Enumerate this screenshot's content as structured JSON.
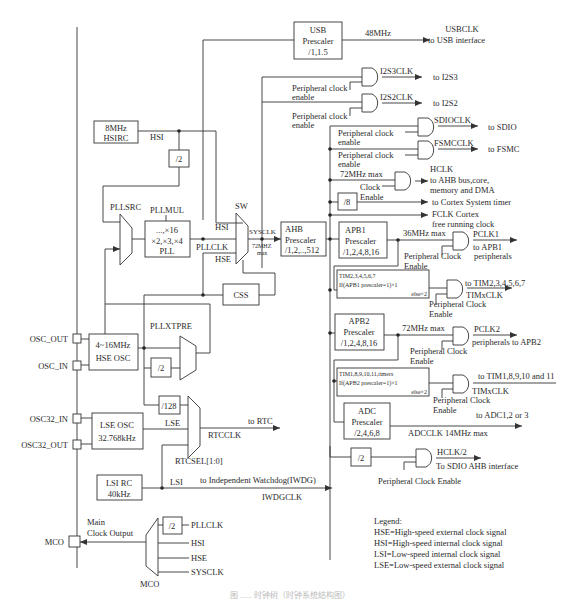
{
  "diagram": {
    "caption": "图 ...... 时钟树（时钟系统结构图）",
    "usb": {
      "box": [
        "USB",
        "Prescaler",
        "/1,1.5"
      ],
      "freq": "48MHz",
      "out1": "USBCLK",
      "out2": "to USB interface"
    },
    "i2s3": {
      "sig": "I2S3CLK",
      "dest": "to I2S3",
      "enable": [
        "Peripheral clock",
        "enable"
      ]
    },
    "i2s2": {
      "sig": "I2S2CLK",
      "dest": "to I2S2",
      "enable": [
        "Peripheral clock",
        "enable"
      ]
    },
    "sdio": {
      "sig": "SDIOCLK",
      "dest": "to SDIO",
      "enable": [
        "Peripheral clock",
        "enable"
      ]
    },
    "fsmc": {
      "sig": "FSMCCLK",
      "dest": "to FSMC",
      "enable": [
        "Peripheral clock",
        "enable"
      ]
    },
    "hclk": {
      "max": "72MHz max",
      "enable": [
        "Clock",
        "Enable"
      ],
      "lines": [
        "HCLK",
        "to AHB bus,core,",
        "memory and DMA"
      ]
    },
    "systimer": {
      "div": "/8",
      "dest": "to Cortex System timer"
    },
    "fclk": {
      "lines": [
        "FCLK Cortex",
        "free running clock"
      ]
    },
    "hsirc": {
      "box": [
        "8MHz",
        "HSIRC"
      ],
      "label": "HSI",
      "div2": "/2"
    },
    "pll": {
      "src": "PLLSRC",
      "mul": "PLLMUL",
      "box": [
        "...,×16",
        "×2,×3,×4",
        "PLL"
      ],
      "out": "PLLCLK"
    },
    "sw": {
      "label": "SW",
      "hsi": "HSI",
      "hse": "HSE",
      "sysclk": "SYSCLK",
      "max": [
        "72MHZ",
        "max"
      ]
    },
    "ahb": {
      "box": [
        "AHB",
        "Prescaler",
        "/1,2,..,512"
      ]
    },
    "apb1": {
      "box": [
        "APB1",
        "Prescaler",
        "/1,2,4,8,16"
      ],
      "max": "36MHz max",
      "out": "PCLK1",
      "dest": "to APB1",
      "enable": [
        "Peripheral Clock",
        "Enable"
      ],
      "peripherals": "peripherals"
    },
    "tim1": {
      "box": [
        "TIM2,3,4,5,6,7",
        "If(APB1 prescaler=1)×1",
        "else×2"
      ],
      "dest": "to TIM2,3,4,5,6,7",
      "sig": "TIMxCLK",
      "enable": [
        "Peripheral Clock",
        "Enable"
      ]
    },
    "apb2": {
      "box": [
        "APB2",
        "Prescaler",
        "/1,2,4,8,16"
      ],
      "max": "72MHz max",
      "out": "PCLK2",
      "dest": "peripherals to APB2",
      "enable": [
        "Peripheral Clock",
        "Enable"
      ]
    },
    "tim2": {
      "box": [
        "TIM1,8,9,10,11,timers",
        "If(APB2 prescaler=1)×1",
        "else×2"
      ],
      "dest": "to TIM1,8,9,10 and 11",
      "sig": "TIMxCLK",
      "enable": [
        "Peripheral Clock",
        "Enable"
      ]
    },
    "adc": {
      "box": [
        "ADC",
        "Prescaler",
        "/2,4,6,8"
      ],
      "dest": "to ADC1,2 or 3",
      "sig": "ADCCLK 14MHz max"
    },
    "sdioahb": {
      "div": "/2",
      "sig": "HCLK/2",
      "dest": "To SDIO AHB interface",
      "enable": "Peripheral Clock Enable"
    },
    "css": "CSS",
    "hse": {
      "pin_out": "OSC_OUT",
      "pin_in": "OSC_IN",
      "box": [
        "4~16MHz",
        "HSE OSC"
      ],
      "pre": "PLLXTPRE",
      "div2": "/2"
    },
    "lse": {
      "pin_in": "OSC32_IN",
      "pin_out": "OSC32_OUT",
      "box": [
        "LSE OSC",
        "32.768kHz"
      ],
      "label": "LSE",
      "div128": "/128",
      "rtc": "to RTC",
      "rtcclk": "RTCCLK",
      "sel": "RTCSEL[1:0]"
    },
    "lsi": {
      "box": [
        "LSI RC",
        "40kHz"
      ],
      "label": "LSI",
      "dest": "to Independent Watchdog(IWDG)",
      "sig": "IWDGCLK"
    },
    "mco": {
      "pin": "MCO",
      "label": [
        "Main",
        "Clock Output"
      ],
      "div2": "/2",
      "inputs": [
        "PLLCLK",
        "HSI",
        "HSE",
        "SYSCLK"
      ],
      "mux": "MCO"
    },
    "legend": {
      "title": "Legend:",
      "items": [
        "HSE=High-speed external clock signal",
        "HSI=High-speed internal clock signal",
        "LSI=Low-speed internal clock signal",
        "LSE=Low-speed external clock signal"
      ]
    }
  }
}
